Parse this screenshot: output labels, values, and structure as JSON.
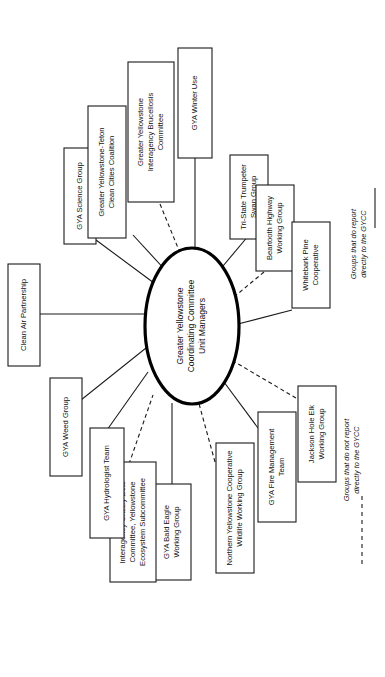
{
  "diagram": {
    "orientation": "rotated-90-ccw",
    "center": {
      "lines": [
        "Greater Yellowstone",
        "Coordinating Committee",
        "Unit Managers"
      ]
    },
    "nodes": [
      {
        "id": "clean-air-partnership",
        "lines": [
          "Clean Air Partnership"
        ],
        "relation": "reports"
      },
      {
        "id": "gya-science-group",
        "lines": [
          "GYA Science Group"
        ],
        "relation": "reports"
      },
      {
        "id": "greater-yellowstone-teton-clean-cities-coalition",
        "lines": [
          "Greater Yellowstone-Teton",
          "Clean Cities Coalition"
        ],
        "relation": "reports"
      },
      {
        "id": "greater-yellowstone-interagency-brucellosis-committee",
        "lines": [
          "Greater Yellowstone",
          "Interagency Brucellosis",
          "Committee"
        ],
        "relation": "not-reports"
      },
      {
        "id": "gya-winter-use",
        "lines": [
          "GYA Winter Use"
        ],
        "relation": "reports"
      },
      {
        "id": "tri-state-trumpeter-swan-group",
        "lines": [
          "Tri-State Trumpeter",
          "Swan Group"
        ],
        "relation": "reports"
      },
      {
        "id": "beartooth-highway-working-group",
        "lines": [
          "Beartooth Highway",
          "Working Group"
        ],
        "relation": "not-reports"
      },
      {
        "id": "whitebark-pine-cooperative",
        "lines": [
          "Whitebark Pine",
          "Cooperative"
        ],
        "relation": "reports"
      },
      {
        "id": "jackson-hole-elk-working-group",
        "lines": [
          "Jackson Hole Elk",
          "Working Group"
        ],
        "relation": "not-reports"
      },
      {
        "id": "gya-fire-management-team",
        "lines": [
          "GYA Fire Management",
          "Team"
        ],
        "relation": "reports"
      },
      {
        "id": "northern-yellowstone-cooperative-wildlife-working-group",
        "lines": [
          "Northern Yellowstone Cooperative",
          "Wildlife Working Group"
        ],
        "relation": "not-reports"
      },
      {
        "id": "gya-bald-eagle-working-group",
        "lines": [
          "GYA Bald Eagle",
          "Working Group"
        ],
        "relation": "reports"
      },
      {
        "id": "interagency-grizzly-bear-committee-yellowstone-ecosystem-subcommittee",
        "lines": [
          "Interagency Grizzly Bear",
          "Committee, Yellowstone",
          "Ecosystem Subcommittee"
        ],
        "relation": "not-reports"
      },
      {
        "id": "gya-hydrologist-team",
        "lines": [
          "GYA Hydrologist Team"
        ],
        "relation": "reports"
      },
      {
        "id": "gya-weed-group",
        "lines": [
          "GYA Weed Group"
        ],
        "relation": "reports"
      }
    ],
    "legend": [
      {
        "id": "legend-reports",
        "lines": [
          "Groups that do report",
          "directly to the GYCC"
        ],
        "style": "solid"
      },
      {
        "id": "legend-not-reports",
        "lines": [
          "Groups that do not report",
          "directly to the GYCC"
        ],
        "style": "dashed"
      }
    ],
    "colors": {
      "background": "#ffffff",
      "stroke": "#1a1a1a",
      "center_stroke": "#000000",
      "text": "#111111"
    }
  }
}
